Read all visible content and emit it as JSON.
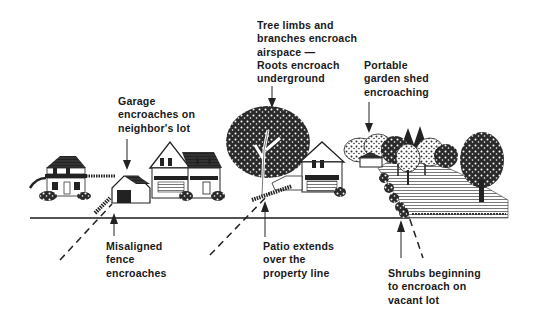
{
  "diagram": {
    "colors": {
      "ink": "#1a1a1a",
      "background": "#ffffff"
    },
    "labels": {
      "tree": {
        "lines": [
          "Tree limbs and",
          "branches encroach",
          "airspace —",
          "Roots encroach",
          "underground"
        ]
      },
      "shed": {
        "lines": [
          "Portable",
          "garden shed",
          "encroaching"
        ]
      },
      "garage": {
        "lines": [
          "Garage",
          "encroaches on",
          "neighbor's lot"
        ]
      },
      "fence": {
        "lines": [
          "Misaligned",
          "fence",
          "encroaches"
        ]
      },
      "patio": {
        "lines": [
          "Patio extends",
          "over the",
          "property line"
        ]
      },
      "shrubs": {
        "lines": [
          "Shrubs beginning",
          "to encroach on",
          "vacant lot"
        ]
      }
    },
    "elements": [
      "house-left",
      "garage",
      "house-two-story",
      "large-tree",
      "house-center",
      "garden-shed",
      "tree-cluster",
      "vacant-lot",
      "lone-tree",
      "ground-line",
      "property-lines"
    ]
  }
}
